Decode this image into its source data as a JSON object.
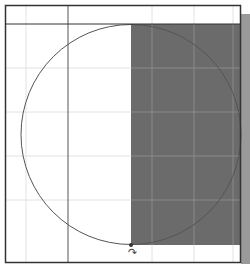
{
  "canvas": {
    "width": 250,
    "height": 264,
    "background": "#ffffff"
  },
  "frame": {
    "left": 5,
    "top": 5,
    "right": 240,
    "bottom": 262,
    "header_line_y": 24,
    "color": "#333333"
  },
  "guide_line": {
    "x": 68,
    "color": "#555555"
  },
  "grid": {
    "color": "#e2e2e2",
    "dark_color": "#8a8a8a",
    "verticals": [
      26,
      152,
      194,
      233
    ],
    "horizontals": [
      68,
      112,
      156,
      200
    ]
  },
  "selection_rect": {
    "x": 131,
    "y": 24,
    "width": 109,
    "height": 221,
    "fill": "#6b6b6b"
  },
  "circle": {
    "cx": 131,
    "cy": 134.5,
    "r": 110,
    "stroke": "#555555"
  },
  "shadow": {
    "color": "#9a9a9a"
  },
  "cursor": {
    "glyph": "↷",
    "icon": "rotate-cursor-icon"
  }
}
